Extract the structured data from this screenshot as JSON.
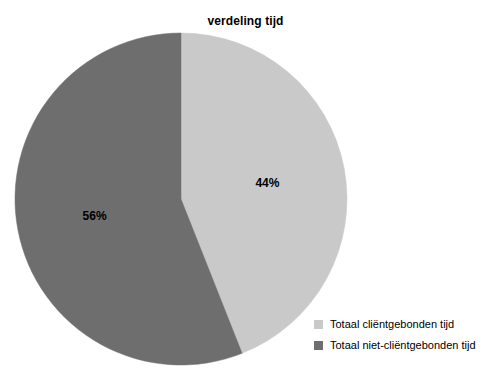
{
  "chart_data": {
    "type": "pie",
    "title": "verdeling tijd",
    "categories": [
      "Totaal cliëntgebonden tijd",
      "Totaal niet-cliëntgebonden tijd"
    ],
    "values": [
      44,
      56
    ],
    "value_labels": [
      "44%",
      "56%"
    ],
    "unit": "%",
    "colors": [
      "#c9c9c9",
      "#6e6e6e"
    ],
    "start_angle_deg": 0,
    "direction": "clockwise",
    "legend_position": "bottom-right",
    "grid": false,
    "xlabel": "",
    "ylabel": "",
    "background": "#ffffff",
    "slices": [
      {
        "name": "Totaal cliëntgebonden tijd",
        "value": 44,
        "label": "44%",
        "color": "#c9c9c9",
        "start_deg": 0,
        "end_deg": 158.4
      },
      {
        "name": "Totaal niet-cliëntgebonden tijd",
        "value": 56,
        "label": "56%",
        "color": "#6e6e6e",
        "start_deg": 158.4,
        "end_deg": 360
      }
    ]
  },
  "legend": {
    "items": [
      {
        "label": "Totaal cliëntgebonden tijd",
        "color": "#c9c9c9"
      },
      {
        "label": "Totaal niet-cliëntgebonden tijd",
        "color": "#6e6e6e"
      }
    ]
  },
  "geometry": {
    "center_x": 181,
    "center_y": 199,
    "radius": 166
  }
}
